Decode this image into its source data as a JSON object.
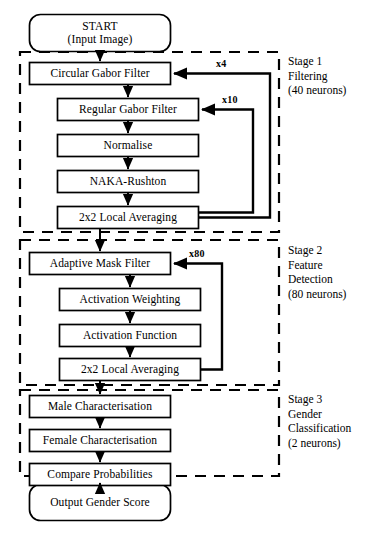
{
  "diagram": {
    "type": "flowchart",
    "terminals": [
      {
        "id": "start",
        "line1": "START",
        "line2": "(Input Image)"
      },
      {
        "id": "output",
        "line1": "Output Gender Score",
        "line2": ""
      }
    ],
    "stages": [
      {
        "id": "stage-1",
        "label_lines": [
          "Stage 1",
          "Filtering",
          "(40 neurons)"
        ],
        "steps": [
          "Circular Gabor Filter",
          "Regular Gabor Filter",
          "Normalise",
          "NAKA-Rushton",
          "2x2 Local Averaging"
        ],
        "loops": [
          {
            "id": "loop-x4",
            "label": "x4",
            "from": "2x2 Local Averaging",
            "to": "Circular Gabor Filter"
          },
          {
            "id": "loop-x10",
            "label": "x10",
            "from": "2x2 Local Averaging",
            "to": "Regular Gabor Filter"
          }
        ]
      },
      {
        "id": "stage-2",
        "label_lines": [
          "Stage 2",
          "Feature",
          "Detection",
          "(80 neurons)"
        ],
        "steps": [
          "Adaptive Mask Filter",
          "Activation Weighting",
          "Activation Function",
          "2x2 Local Averaging"
        ],
        "loops": [
          {
            "id": "loop-x80",
            "label": "x80",
            "from": "2x2 Local Averaging",
            "to": "Adaptive Mask Filter"
          }
        ]
      },
      {
        "id": "stage-3",
        "label_lines": [
          "Stage 3",
          "Gender",
          "Classification",
          "(2 neurons)"
        ],
        "steps": [
          "Male Characterisation",
          "Female Characterisation",
          "Compare Probabilities"
        ],
        "loops": []
      }
    ],
    "caption": "",
    "colors": {
      "stroke": "#000000",
      "background": "#ffffff",
      "box_fill": "#ffffff"
    }
  }
}
